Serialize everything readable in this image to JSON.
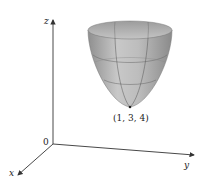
{
  "diagram": {
    "type": "3d-surface-plot",
    "surface": "elliptic paraboloid opening upward",
    "axes": {
      "x_label": "x",
      "y_label": "y",
      "z_label": "z",
      "origin_label": "0"
    },
    "vertex_label": "(1, 3, 4)",
    "colors": {
      "surface_light": "#d4d4d4",
      "surface_dark": "#9a9a9a",
      "axis": "#333333",
      "background": "#ffffff"
    }
  }
}
